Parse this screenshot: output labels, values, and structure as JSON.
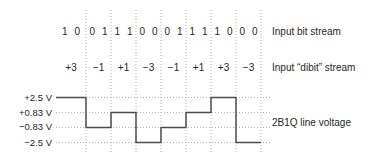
{
  "figure": {
    "row_labels": {
      "bit_stream": "Input bit stream",
      "dibit_stream": "Input “dibit” stream",
      "line_voltage": "2B1Q line voltage"
    },
    "cells": [
      {
        "bits": "1 0",
        "dibit": "+3",
        "volts": 2.5
      },
      {
        "bits": "0 1",
        "dibit": "−1",
        "volts": -0.83
      },
      {
        "bits": "1 1",
        "dibit": "+1",
        "volts": 0.83
      },
      {
        "bits": "0 0",
        "dibit": "−3",
        "volts": -2.5
      },
      {
        "bits": "0 1",
        "dibit": "−1",
        "volts": -0.83
      },
      {
        "bits": "1 1",
        "dibit": "+1",
        "volts": 0.83
      },
      {
        "bits": "1 0",
        "dibit": "+3",
        "volts": 2.5
      },
      {
        "bits": "0 0",
        "dibit": "−3",
        "volts": -2.5
      }
    ],
    "voltage_axis_labels": [
      "+2.5 V",
      "+0.83 V",
      "−0.83 V",
      "−2.5 V"
    ],
    "voltage_levels": [
      2.5,
      0.83,
      -0.83,
      -2.5
    ],
    "colors": {
      "waveform": "#4d4d4d",
      "grid": "#b0b0b0",
      "text": "#262626"
    }
  }
}
